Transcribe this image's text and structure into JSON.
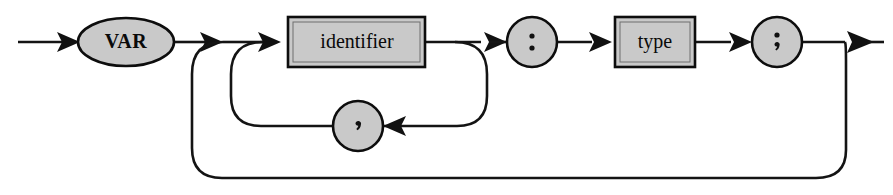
{
  "diagram": {
    "kind": "railroad-syntax-diagram",
    "canvas": {
      "width": 893,
      "height": 195,
      "background": "#ffffff"
    },
    "colors": {
      "line": "#141414",
      "shape_fill": "#c9c9c9",
      "shape_stroke": "#0d0d0d",
      "text": "#0a0a0a"
    },
    "nodes": [
      {
        "id": "var",
        "label": "VAR",
        "shape": "ellipse",
        "role": "terminal",
        "cx": 126,
        "cy": 42,
        "rx": 48,
        "ry": 24
      },
      {
        "id": "identifier",
        "label": "identifier",
        "shape": "rect",
        "role": "nonterminal",
        "x": 288,
        "y": 17,
        "width": 137,
        "height": 50
      },
      {
        "id": "colon",
        "label": ":",
        "shape": "circle",
        "role": "terminal",
        "cx": 532,
        "cy": 42,
        "r": 25
      },
      {
        "id": "type",
        "label": "type",
        "shape": "rect",
        "role": "nonterminal",
        "x": 615,
        "y": 17,
        "width": 80,
        "height": 50
      },
      {
        "id": "semicolon",
        "label": ";",
        "shape": "circle",
        "role": "terminal",
        "cx": 777,
        "cy": 42,
        "r": 25
      },
      {
        "id": "comma",
        "label": ",",
        "shape": "circle",
        "role": "terminal",
        "cx": 358,
        "cy": 126,
        "r": 25
      }
    ],
    "paths": [
      {
        "id": "entry",
        "from": "start",
        "to": "var",
        "direction": "right"
      },
      {
        "id": "var-to-identifier",
        "from": "var",
        "to": "identifier",
        "direction": "right"
      },
      {
        "id": "identifier-to-colon",
        "from": "identifier",
        "to": "colon",
        "direction": "right"
      },
      {
        "id": "colon-to-type",
        "from": "colon",
        "to": "type",
        "direction": "right"
      },
      {
        "id": "type-to-semicolon",
        "from": "type",
        "to": "semicolon",
        "direction": "right"
      },
      {
        "id": "exit",
        "from": "semicolon",
        "to": "end",
        "direction": "right"
      },
      {
        "id": "comma-loop",
        "from": "identifier",
        "to": "identifier",
        "via": "comma",
        "direction": "left"
      },
      {
        "id": "declaration-loop",
        "from": "semicolon",
        "to": "identifier",
        "direction": "left"
      }
    ],
    "labels": {
      "var": "VAR",
      "identifier": "identifier",
      "colon": ":",
      "type": "type",
      "semicolon": ";",
      "comma": ","
    }
  }
}
